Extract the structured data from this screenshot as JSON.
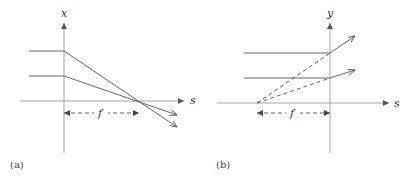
{
  "panels": [
    {
      "id": "a",
      "caption": "(a)",
      "vertical_axis_label": "x",
      "horizontal_axis_label": "s",
      "distance_label": "f",
      "description": "Two parallel horizontal rays converge to the focal point on the s axis at distance f right of the lens (x-axis)"
    },
    {
      "id": "b",
      "caption": "(b)",
      "vertical_axis_label": "y",
      "horizontal_axis_label": "s",
      "distance_label": "f",
      "description": "Two parallel horizontal rays diverge after the lens (y-axis); dashed back-extensions meet at a virtual focal point at distance f left of the lens"
    }
  ],
  "colors": {
    "axis": "#9a9a9a",
    "ray": "#555555",
    "text": "#333333"
  }
}
